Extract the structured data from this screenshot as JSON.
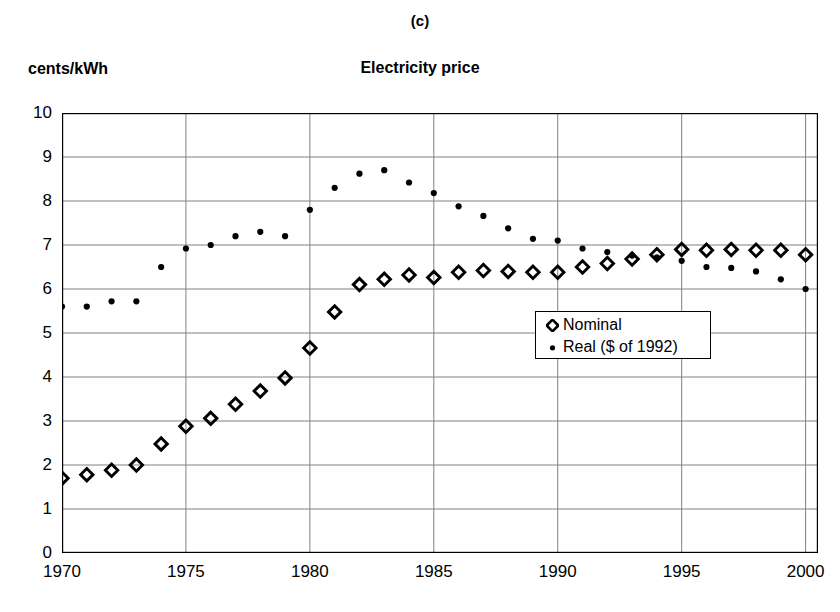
{
  "figure": {
    "panel_label": "(c)",
    "title": "Electricity   price",
    "y_axis_label": "cents/kWh"
  },
  "legend": {
    "position": "inside-center-right",
    "entries": [
      {
        "label": "Nominal",
        "marker": "open-diamond"
      },
      {
        "label": "Real ($ of 1992)",
        "marker": "filled-dot"
      }
    ]
  },
  "axis": {
    "y_ticks": [
      "0",
      "1",
      "2",
      "3",
      "4",
      "5",
      "6",
      "7",
      "8",
      "9",
      "10"
    ],
    "x_ticks": [
      "1970",
      "1975",
      "1980",
      "1985",
      "1990",
      "1995",
      "2000"
    ]
  },
  "colors": {
    "series": "#000000",
    "grid": "#808080",
    "axis": "#000000",
    "background": "#ffffff"
  },
  "chart_data": {
    "type": "scatter",
    "title": "Electricity   price",
    "subtitle": "(c)",
    "xlabel": "",
    "ylabel": "cents/kWh",
    "xlim": [
      1970,
      2000.5
    ],
    "ylim": [
      0,
      10
    ],
    "grid": true,
    "legend_position": "center-right inside plot",
    "x": [
      1970,
      1971,
      1972,
      1973,
      1974,
      1975,
      1976,
      1977,
      1978,
      1979,
      1980,
      1981,
      1982,
      1983,
      1984,
      1985,
      1986,
      1987,
      1988,
      1989,
      1990,
      1991,
      1992,
      1993,
      1994,
      1995,
      1996,
      1997,
      1998,
      1999,
      2000
    ],
    "series": [
      {
        "name": "Nominal",
        "marker": "open-diamond",
        "values": [
          1.7,
          1.78,
          1.88,
          2.0,
          2.48,
          2.88,
          3.06,
          3.38,
          3.68,
          3.98,
          4.66,
          5.48,
          6.1,
          6.22,
          6.32,
          6.26,
          6.38,
          6.42,
          6.4,
          6.38,
          6.38,
          6.5,
          6.58,
          6.68,
          6.78,
          6.9,
          6.88,
          6.9,
          6.88,
          6.88,
          6.78
        ]
      },
      {
        "name": "Real ($ of 1992)",
        "marker": "filled-dot",
        "values": [
          5.6,
          5.6,
          5.72,
          5.72,
          6.5,
          6.92,
          7.0,
          7.2,
          7.3,
          7.2,
          7.8,
          8.3,
          8.62,
          8.7,
          8.42,
          8.18,
          7.88,
          7.66,
          7.38,
          7.14,
          7.1,
          6.92,
          6.84,
          6.76,
          6.72,
          6.64,
          6.5,
          6.48,
          6.4,
          6.22,
          6.0
        ]
      }
    ]
  }
}
